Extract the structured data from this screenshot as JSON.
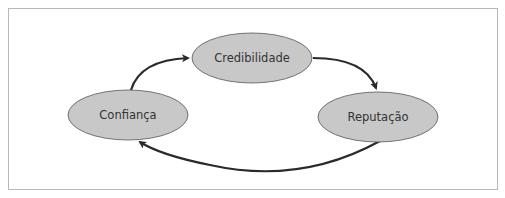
{
  "diagram": {
    "type": "cycle",
    "nodes": [
      {
        "id": "credibilidade",
        "label": "Credibilidade"
      },
      {
        "id": "reputacao",
        "label": "Reputação"
      },
      {
        "id": "confianca",
        "label": "Confiança"
      }
    ],
    "edges": [
      {
        "from": "confianca",
        "to": "credibilidade"
      },
      {
        "from": "credibilidade",
        "to": "reputacao"
      },
      {
        "from": "reputacao",
        "to": "confianca"
      }
    ],
    "colors": {
      "node_fill": "#c8c8c8",
      "node_stroke": "#555555",
      "arrow": "#2a2a2a",
      "frame": "#b8b8b8"
    }
  }
}
